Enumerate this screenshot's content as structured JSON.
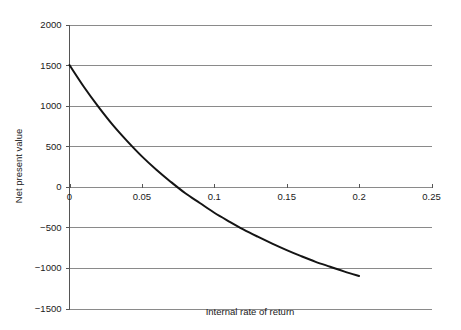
{
  "chart_data": {
    "type": "line",
    "title": "",
    "subtitle": "",
    "xlabel": "Internal rate of return",
    "ylabel": "Net present value",
    "xlim": [
      0,
      0.25
    ],
    "ylim": [
      -1500,
      2000
    ],
    "grid": true,
    "legend": false,
    "legend_position": "none",
    "xticks": [
      0,
      0.05,
      0.1,
      0.15,
      0.2,
      0.25
    ],
    "xtick_labels": [
      "0",
      "0.05",
      "0.1",
      "0.15",
      "0.2",
      "0.25"
    ],
    "yticks": [
      -1500,
      -1000,
      -500,
      0,
      500,
      1000,
      1500,
      2000
    ],
    "ytick_labels": [
      "-1500",
      "-1000",
      "-500",
      "0",
      "500",
      "1000",
      "1500",
      "2000"
    ],
    "series": [
      {
        "name": "Net present value",
        "color": "#141414",
        "x": [
          0,
          0.01,
          0.02,
          0.03,
          0.04,
          0.05,
          0.06,
          0.07,
          0.08,
          0.09,
          0.1,
          0.11,
          0.12,
          0.13,
          0.14,
          0.15,
          0.16,
          0.17,
          0.18,
          0.19,
          0.2
        ],
        "values": [
          1500,
          1230,
          985,
          760,
          560,
          375,
          210,
          60,
          -80,
          -200,
          -320,
          -425,
          -525,
          -615,
          -700,
          -780,
          -855,
          -925,
          -985,
          -1045,
          -1100
        ]
      }
    ],
    "annotations": [],
    "zero_crossing_x": 0.0645,
    "colors": {
      "curve": "#141414",
      "gridline": "#8a8a8a",
      "axis": "#555555",
      "text": "#1a1a1a",
      "background": "#ffffff"
    }
  },
  "axis_titles": {
    "x": "Internal rate of return",
    "y": "Net present value"
  }
}
